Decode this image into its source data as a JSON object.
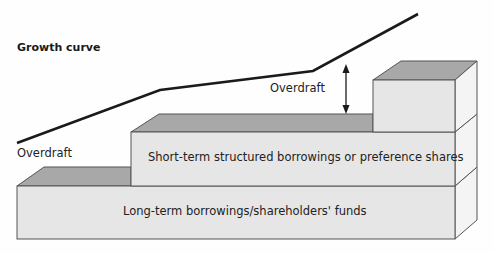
{
  "diagram": {
    "title": "Growth curve",
    "labels": {
      "overdraft_left": "Overdraft",
      "overdraft_right": "Overdraft",
      "mid_block": "Short-term structured borrowings or preference shares",
      "bottom_block": "Long-term borrowings/shareholders' funds"
    },
    "curve_points": [
      [
        17,
        143
      ],
      [
        160,
        90
      ],
      [
        313,
        71
      ],
      [
        418,
        14
      ]
    ],
    "colors": {
      "front_face": "#e6e6e6",
      "top_face": "#a8a8a8",
      "side_face": "#f4f4f4",
      "edge": "#555555",
      "curve": "#1a1a1a"
    }
  }
}
